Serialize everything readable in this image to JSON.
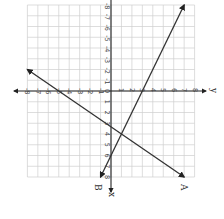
{
  "chart_data": {
    "type": "line",
    "title": "",
    "orientation_note": "figure rotated 90 degrees clockwise",
    "xlabel": "x",
    "ylabel": "y",
    "x_axis": {
      "label": "x",
      "range": [
        -8,
        8
      ],
      "direction": "vertical, positive downward"
    },
    "y_axis": {
      "label": "y",
      "range": [
        -8,
        8
      ],
      "direction": "horizontal, positive rightward"
    },
    "grid": true,
    "tick_labels_x": [
      "-8",
      "-7",
      "-6",
      "-5",
      "-4",
      "-3",
      "-2",
      "-1",
      "0",
      "1",
      "2",
      "3",
      "4",
      "5",
      "6",
      "7",
      "8"
    ],
    "tick_labels_y": [
      "-8",
      "-7",
      "-6",
      "-5",
      "-4",
      "-3",
      "-2",
      "-1",
      "0",
      "1",
      "2",
      "3",
      "4",
      "5",
      "6",
      "7",
      "8"
    ],
    "series": [
      {
        "name": "A",
        "label": "A",
        "description": "steep line with arrows at both ends",
        "points": [
          {
            "y": 7,
            "x": -8
          },
          {
            "y": 3,
            "x": 0
          },
          {
            "y": 1,
            "x": 4
          },
          {
            "y": -1,
            "x": 8
          }
        ]
      },
      {
        "name": "B",
        "label": "B",
        "description": "shallow line with arrows at both ends",
        "points": [
          {
            "y": -8,
            "x": -2
          },
          {
            "y": -5,
            "x": 0
          },
          {
            "y": 1,
            "x": 4
          },
          {
            "y": 7,
            "x": 8
          }
        ]
      }
    ],
    "intersection": {
      "x": 4,
      "y": 1
    }
  },
  "labels": {
    "x_axis": "x",
    "y_axis": "y",
    "line_a": "A",
    "line_b": "B"
  }
}
